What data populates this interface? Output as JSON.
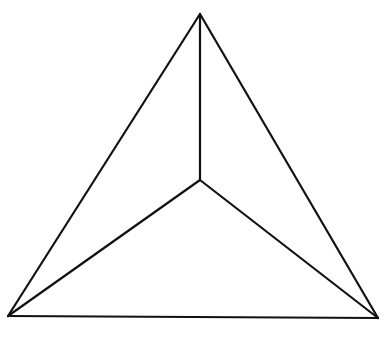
{
  "diagram": {
    "stroke_color": "#111111",
    "stroke_width": 2.2,
    "background": "#ffffff",
    "vertices": {
      "top": [
        200,
        14
      ],
      "bottom_left": [
        8,
        316
      ],
      "bottom_right": [
        378,
        318
      ],
      "center": [
        200,
        180
      ]
    },
    "edges": [
      {
        "name": "outer-left-edge",
        "from": "top",
        "to": "bottom_left"
      },
      {
        "name": "outer-right-edge",
        "from": "top",
        "to": "bottom_right"
      },
      {
        "name": "outer-bottom-edge",
        "from": "bottom_left",
        "to": "bottom_right"
      },
      {
        "name": "inner-top-spoke",
        "from": "center",
        "to": "top"
      },
      {
        "name": "inner-left-spoke",
        "from": "center",
        "to": "bottom_left"
      },
      {
        "name": "inner-right-spoke",
        "from": "center",
        "to": "bottom_right"
      }
    ]
  }
}
